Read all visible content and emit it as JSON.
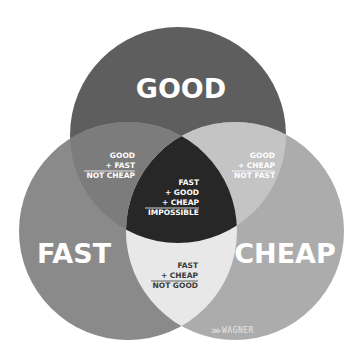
{
  "diagram": {
    "type": "venn",
    "sets": [
      {
        "id": "good",
        "label": "GOOD",
        "color": "#5e5e5e"
      },
      {
        "id": "fast",
        "label": "FAST",
        "color": "#8a8a8a"
      },
      {
        "id": "cheap",
        "label": "CHEAP",
        "color": "#acacac"
      }
    ],
    "intersections": {
      "good_fast": {
        "lines": [
          "GOOD",
          "+ FAST"
        ],
        "result": "NOT CHEAP",
        "color": "#7c7c7c",
        "text_color": "#ffffff"
      },
      "good_cheap": {
        "lines": [
          "GOOD",
          "+ CHEAP"
        ],
        "result": "NOT FAST",
        "color": "#c4c4c4",
        "text_color": "#ffffff"
      },
      "fast_cheap": {
        "lines": [
          "FAST",
          "+ CHEAP"
        ],
        "result": "NOT GOOD",
        "color": "#e8e8e8",
        "text_color": "#3a3a3a"
      },
      "all": {
        "lines": [
          "FAST",
          "+ GOOD",
          "+ CHEAP"
        ],
        "result": "IMPOSSIBLE",
        "color": "#272727",
        "text_color": "#ffffff"
      }
    },
    "logo": {
      "text": "WAGNER",
      "mark": "⋙"
    }
  }
}
